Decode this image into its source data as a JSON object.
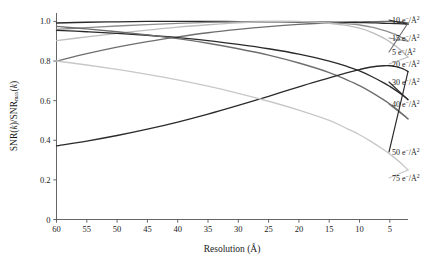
{
  "chart_data": {
    "type": "line",
    "title": "",
    "xlabel": "Resolution (Å)",
    "ylabel": "SNR(k)/SNRmax(k)",
    "ylabel_parts": {
      "pre": "SNR(",
      "k1": "k",
      "mid": ")/SNR",
      "sub": "max",
      "open": "(",
      "k2": "k",
      "close": ")"
    },
    "x_ticks": [
      60,
      55,
      50,
      45,
      40,
      35,
      30,
      25,
      20,
      15,
      10,
      5
    ],
    "x_tick_labels": [
      "60",
      "55",
      "50",
      "45",
      "40",
      "35",
      "30",
      "25",
      "20",
      "15",
      "10",
      "5"
    ],
    "y_ticks": [
      0,
      0.2,
      0.4,
      0.6,
      0.8,
      1.0
    ],
    "y_tick_labels": [
      "0",
      "0.2",
      "0.4",
      "0.6",
      "0.8",
      "1.0"
    ],
    "xlim": [
      60,
      2
    ],
    "ylim": [
      0,
      1.04
    ],
    "x_axis_reversed": true,
    "grid": false,
    "legend_position": "right-outside",
    "x": [
      60,
      55,
      50,
      45,
      40,
      35,
      30,
      25,
      20,
      15,
      12,
      10,
      8,
      6,
      5,
      4,
      3,
      2.5,
      2
    ],
    "series": [
      {
        "name": "5 e−/Å²",
        "label_number": "5",
        "label_unit": "e−/Å²",
        "color": "#6e6e6e",
        "values": [
          0.8,
          0.837,
          0.87,
          0.898,
          0.922,
          0.943,
          0.96,
          0.974,
          0.985,
          0.993,
          0.996,
          0.998,
          0.999,
          1.0,
          1.0,
          0.999,
          0.997,
          0.995,
          0.992
        ]
      },
      {
        "name": "10 e−/Å²",
        "label_number": "10",
        "label_unit": "e−/Å²",
        "color": "#2a2a2a",
        "values": [
          0.992,
          0.996,
          0.998,
          1.0,
          1.0,
          1.0,
          0.999,
          0.998,
          0.997,
          0.996,
          0.995,
          0.994,
          0.993,
          0.991,
          0.99,
          0.989,
          0.988,
          0.987,
          0.986
        ]
      },
      {
        "name": "15 e−/Å²",
        "label_number": "15",
        "label_unit": "e−/Å²",
        "color": "#8f8f8f",
        "values": [
          0.96,
          0.969,
          0.977,
          0.984,
          0.99,
          0.995,
          0.998,
          1.0,
          0.999,
          0.994,
          0.988,
          0.982,
          0.971,
          0.955,
          0.945,
          0.933,
          0.918,
          0.91,
          0.9
        ]
      },
      {
        "name": "20 e−/Å²",
        "label_number": "20",
        "label_unit": "e−/Å²",
        "color": "#bdbdbd",
        "values": [
          0.903,
          0.922,
          0.94,
          0.956,
          0.971,
          0.983,
          0.993,
          0.999,
          1.0,
          0.991,
          0.979,
          0.966,
          0.945,
          0.916,
          0.897,
          0.875,
          0.85,
          0.836,
          0.82
        ]
      },
      {
        "name": "30 e−/Å²",
        "label_number": "30",
        "label_unit": "e−/Å²",
        "color": "#2a2a2a",
        "values": [
          0.955,
          0.948,
          0.94,
          0.93,
          0.918,
          0.903,
          0.884,
          0.862,
          0.835,
          0.8,
          0.772,
          0.75,
          0.722,
          0.69,
          0.672,
          0.652,
          0.63,
          0.618,
          0.605
        ]
      },
      {
        "name": "40 e−/Å²",
        "label_number": "40",
        "label_unit": "e−/Å²",
        "color": "#6e6e6e",
        "values": [
          0.975,
          0.962,
          0.948,
          0.932,
          0.913,
          0.89,
          0.862,
          0.83,
          0.79,
          0.742,
          0.704,
          0.676,
          0.642,
          0.604,
          0.583,
          0.56,
          0.535,
          0.522,
          0.508
        ]
      },
      {
        "name": "50 e−/Å²",
        "label_number": "50",
        "label_unit": "e−/Å²",
        "color": "#2a2a2a",
        "values": [
          0.372,
          0.396,
          0.424,
          0.456,
          0.492,
          0.532,
          0.576,
          0.622,
          0.67,
          0.715,
          0.742,
          0.757,
          0.77,
          0.776,
          0.776,
          0.772,
          0.763,
          0.756,
          0.747
        ]
      },
      {
        "name": "75 e−/Å²",
        "label_number": "75",
        "label_unit": "e−/Å²",
        "color": "#c8c8c8",
        "values": [
          0.8,
          0.78,
          0.758,
          0.733,
          0.705,
          0.673,
          0.637,
          0.597,
          0.552,
          0.5,
          0.458,
          0.428,
          0.392,
          0.352,
          0.33,
          0.306,
          0.28,
          0.265,
          0.25
        ]
      }
    ],
    "legend_entries": [
      {
        "number": "10",
        "unit": "e−/Å²",
        "color": "#2a2a2a"
      },
      {
        "number": "15",
        "unit": "e−/Å²",
        "color": "#8f8f8f"
      },
      {
        "number": "5",
        "unit": "e−/Å²",
        "color": "#6e6e6e"
      },
      {
        "number": "20",
        "unit": "e−/Å²",
        "color": "#bdbdbd"
      },
      {
        "number": "30",
        "unit": "e−/Å²",
        "color": "#2a2a2a"
      },
      {
        "number": "40",
        "unit": "e−/Å²",
        "color": "#6e6e6e"
      },
      {
        "number": "50",
        "unit": "e−/Å²",
        "color": "#2a2a2a"
      },
      {
        "number": "75",
        "unit": "e−/Å²",
        "color": "#c8c8c8"
      }
    ]
  }
}
